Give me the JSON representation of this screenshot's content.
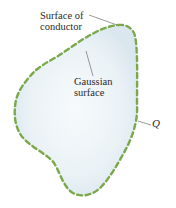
{
  "figure": {
    "labels": {
      "conductor_line1": "Surface of",
      "conductor_line2": "conductor",
      "gaussian_line1": "Gaussian",
      "gaussian_line2": "surface",
      "charge": "Q"
    },
    "colors": {
      "background": "#ffffff",
      "conductor_fill": "#e4eef4",
      "conductor_center": "#f7fafc",
      "gaussian_dash": "#7aa84a",
      "leader_line": "#555555",
      "text": "#2a2a2a"
    }
  }
}
